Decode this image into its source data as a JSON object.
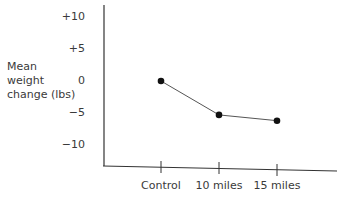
{
  "chart_data": {
    "type": "line",
    "title": "",
    "xlabel": "",
    "ylabel": "Mean\nweight\nchange (lbs)",
    "categories": [
      "Control",
      "10 miles",
      "15 miles"
    ],
    "series": [
      {
        "name": "Mean weight change",
        "values": [
          0,
          -5.3,
          -6.2
        ]
      }
    ],
    "yticks": [
      "+10",
      "+5",
      "0",
      "−5",
      "−10"
    ],
    "ytick_values": [
      10,
      5,
      0,
      -5,
      -10
    ],
    "ylim": [
      -13,
      12
    ],
    "grid": false,
    "legend": null,
    "colors": {
      "line": "#555555",
      "marker": "#111111",
      "axis": "#333333"
    }
  }
}
